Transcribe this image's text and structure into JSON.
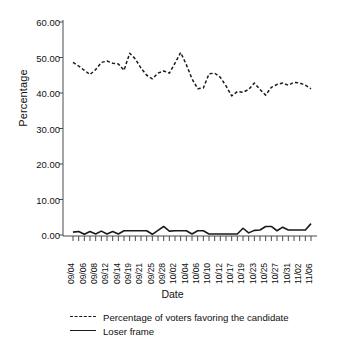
{
  "chart_data": {
    "type": "line",
    "title": "",
    "xlabel": "Date",
    "ylabel": "Percentage",
    "ylim": [
      0,
      60
    ],
    "yticks": [
      "0.00",
      "10.00",
      "20.00",
      "30.00",
      "40.00",
      "50.00",
      "60.00"
    ],
    "ytick_values": [
      0,
      10,
      20,
      30,
      40,
      50,
      60
    ],
    "grid": false,
    "legend_position": "below-axis-left",
    "categories": [
      "09/04",
      "09/05",
      "09/06",
      "09/07",
      "09/08",
      "09/11",
      "09/12",
      "09/13",
      "09/14",
      "09/18",
      "09/19",
      "09/20",
      "09/21",
      "09/24",
      "09/25",
      "09/26",
      "09/28",
      "10/01",
      "10/02",
      "10/03",
      "10/04",
      "10/05",
      "10/06",
      "10/09",
      "10/10",
      "10/11",
      "10/12",
      "10/16",
      "10/17",
      "10/18",
      "10/19",
      "10/22",
      "10/23",
      "10/24",
      "10/25",
      "10/26",
      "10/27",
      "10/30",
      "10/31",
      "11/01",
      "11/02",
      "11/05",
      "11/06"
    ],
    "xtick_labels": [
      "09/04",
      "09/06",
      "09/08",
      "09/12",
      "09/14",
      "09/19",
      "09/21",
      "09/25",
      "09/28",
      "10/02",
      "10/04",
      "10/06",
      "10/10",
      "10/12",
      "10/17",
      "10/19",
      "10/23",
      "10/25",
      "10/27",
      "10/31",
      "11/02",
      "11/06"
    ],
    "series": [
      {
        "name": "Percentage of voters favoring the candidate",
        "style": "dashed",
        "color": "#1a1a1a",
        "values": [
          48.6,
          47.6,
          46.4,
          45.2,
          46.6,
          48.6,
          49.0,
          48.4,
          48.2,
          46.4,
          51.2,
          49.6,
          47.0,
          45.0,
          44.0,
          45.6,
          46.2,
          45.6,
          48.4,
          51.4,
          48.0,
          44.0,
          41.2,
          41.4,
          45.4,
          45.6,
          44.4,
          42.0,
          39.2,
          40.4,
          40.2,
          41.0,
          42.8,
          41.0,
          39.4,
          41.6,
          42.4,
          42.8,
          42.2,
          43.0,
          42.8,
          42.2,
          41.2
        ]
      },
      {
        "name": "Loser frame",
        "style": "solid",
        "color": "#1a1a1a",
        "values": [
          0.8,
          1.0,
          0.2,
          1.0,
          0.3,
          1.1,
          0.3,
          1.0,
          0.3,
          1.2,
          1.2,
          1.2,
          1.2,
          1.2,
          0.2,
          1.3,
          2.4,
          1.1,
          1.2,
          1.2,
          1.2,
          0.3,
          1.2,
          1.2,
          0.3,
          0.3,
          0.3,
          0.3,
          0.3,
          0.3,
          1.9,
          0.6,
          1.3,
          1.4,
          2.4,
          2.4,
          1.2,
          2.2,
          1.4,
          1.4,
          1.4,
          1.4,
          3.2
        ]
      }
    ]
  },
  "legend": {
    "items": [
      {
        "label": "Percentage of voters favoring the candidate",
        "style": "dashed"
      },
      {
        "label": "Loser frame",
        "style": "solid"
      }
    ]
  }
}
